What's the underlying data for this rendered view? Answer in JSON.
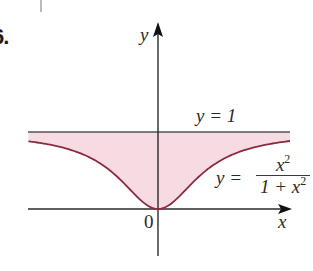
{
  "figure": {
    "problem_number": "6.",
    "axes": {
      "x_label": "x",
      "y_label": "y",
      "origin_label": "0"
    },
    "labels": {
      "upper_line": "y = 1",
      "curve_lhs": "y =",
      "curve_numerator_base": "x",
      "curve_numerator_exp": "2",
      "curve_denominator_base": "1 + x",
      "curve_denominator_exp": "2"
    },
    "colors": {
      "shading": "#f7dbe3",
      "curve": "#8b2b3e",
      "line": "#555555",
      "axis": "#2a2a2a"
    }
  },
  "chart_data": {
    "type": "area",
    "title": "",
    "xlabel": "x",
    "ylabel": "y",
    "series": [
      {
        "name": "y = 1",
        "kind": "line",
        "x": [
          -2.7,
          2.75
        ],
        "values": [
          1,
          1
        ]
      },
      {
        "name": "y = x^2/(1+x^2)",
        "kind": "curve",
        "x": [
          -2.7,
          -2.0,
          -1.5,
          -1.0,
          -0.5,
          0,
          0.5,
          1.0,
          1.5,
          2.0,
          2.75
        ],
        "values": [
          0.879,
          0.8,
          0.692,
          0.5,
          0.2,
          0,
          0.2,
          0.5,
          0.692,
          0.8,
          0.883
        ]
      }
    ],
    "shaded_region": "between y = x^2/(1+x^2) and y = 1",
    "annotations": [
      "y = 1",
      "y = x^2/(1 + x^2)",
      "0"
    ],
    "xlim": [
      -2.7,
      2.75
    ],
    "ylim": [
      0,
      1
    ],
    "grid": false,
    "legend": "none"
  }
}
